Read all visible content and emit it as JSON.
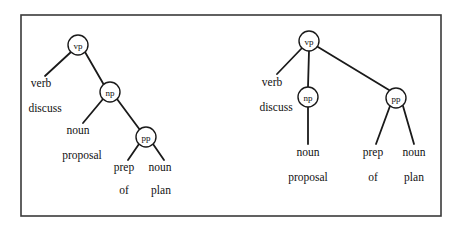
{
  "figure": {
    "background_color": "#ffffff",
    "ink_color": "#111111",
    "frame_color": "#3a3a3a",
    "frame": {
      "x": 21,
      "y": 15,
      "width": 420,
      "height": 201
    }
  },
  "trees": [
    {
      "id": "tree-left",
      "name": "left-parse-tree",
      "description": "Right-branching attachment: np dominates noun and pp",
      "nodes": [
        {
          "id": "vp",
          "label": "vp",
          "x": 78,
          "y": 45,
          "r": 10
        },
        {
          "id": "np",
          "label": "np",
          "x": 110,
          "y": 92,
          "r": 10
        },
        {
          "id": "pp",
          "label": "pp",
          "x": 146,
          "y": 137,
          "r": 10
        }
      ],
      "edges": [
        {
          "from": "vp",
          "to": "verb",
          "x1": 71,
          "y1": 52,
          "x2": 45,
          "y2": 76
        },
        {
          "from": "vp",
          "to": "np",
          "x1": 85,
          "y1": 52,
          "x2": 104,
          "y2": 85
        },
        {
          "from": "np",
          "to": "noun",
          "x1": 103,
          "y1": 99,
          "x2": 83,
          "y2": 123
        },
        {
          "from": "np",
          "to": "pp",
          "x1": 117,
          "y1": 99,
          "x2": 140,
          "y2": 130
        },
        {
          "from": "pp",
          "to": "prep",
          "x1": 139,
          "y1": 144,
          "x2": 128,
          "y2": 160
        },
        {
          "from": "pp",
          "to": "noun2",
          "x1": 153,
          "y1": 144,
          "x2": 164,
          "y2": 160
        }
      ],
      "leaves": [
        {
          "id": "verb",
          "pos": "verb",
          "word": "discuss",
          "pos_x": 41,
          "pos_y": 83,
          "word_x": 45,
          "word_y": 108
        },
        {
          "id": "noun",
          "pos": "noun",
          "word": "proposal",
          "pos_x": 78,
          "pos_y": 130,
          "word_x": 82,
          "word_y": 155
        },
        {
          "id": "prep",
          "pos": "prep",
          "word": "of",
          "pos_x": 124,
          "pos_y": 167,
          "word_x": 124,
          "word_y": 190
        },
        {
          "id": "noun2",
          "pos": "noun",
          "word": "plan",
          "pos_x": 160,
          "pos_y": 167,
          "word_x": 161,
          "word_y": 190
        }
      ]
    },
    {
      "id": "tree-right",
      "name": "right-parse-tree",
      "description": "Flat attachment: vp dominates verb, np and pp",
      "nodes": [
        {
          "id": "vp",
          "label": "vp",
          "x": 309,
          "y": 41,
          "r": 10
        },
        {
          "id": "np",
          "label": "np",
          "x": 308,
          "y": 97,
          "r": 10
        },
        {
          "id": "pp",
          "label": "pp",
          "x": 396,
          "y": 98,
          "r": 10
        }
      ],
      "edges": [
        {
          "from": "vp",
          "to": "verb",
          "x1": 302,
          "y1": 48,
          "x2": 277,
          "y2": 74
        },
        {
          "from": "vp",
          "to": "np",
          "x1": 309,
          "y1": 51,
          "x2": 308,
          "y2": 87
        },
        {
          "from": "vp",
          "to": "pp",
          "x1": 318,
          "y1": 47,
          "x2": 389,
          "y2": 90
        },
        {
          "from": "np",
          "to": "noun",
          "x1": 308,
          "y1": 107,
          "x2": 308,
          "y2": 144
        },
        {
          "from": "pp",
          "to": "prep",
          "x1": 390,
          "y1": 106,
          "x2": 376,
          "y2": 144
        },
        {
          "from": "pp",
          "to": "noun2",
          "x1": 403,
          "y1": 106,
          "x2": 414,
          "y2": 144
        }
      ],
      "leaves": [
        {
          "id": "verb",
          "pos": "verb",
          "word": "discuss",
          "pos_x": 272,
          "pos_y": 82,
          "word_x": 276,
          "word_y": 107
        },
        {
          "id": "noun",
          "pos": "noun",
          "word": "proposal",
          "pos_x": 308,
          "pos_y": 152,
          "word_x": 308,
          "word_y": 177
        },
        {
          "id": "prep",
          "pos": "prep",
          "word": "of",
          "pos_x": 373,
          "pos_y": 152,
          "word_x": 373,
          "word_y": 177
        },
        {
          "id": "noun2",
          "pos": "noun",
          "word": "plan",
          "pos_x": 414,
          "pos_y": 152,
          "word_x": 414,
          "word_y": 177
        }
      ]
    }
  ]
}
